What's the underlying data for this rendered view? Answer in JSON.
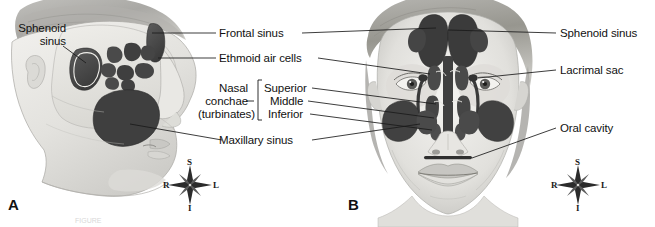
{
  "figure": {
    "caption_partial": "FIGURE",
    "panels": [
      {
        "id": "A",
        "letter": "A",
        "view": "lateral-sagittal-view"
      },
      {
        "id": "B",
        "letter": "B",
        "view": "anterior-frontal-view"
      }
    ]
  },
  "labels": {
    "left": [
      {
        "name": "sphenoid-sinus",
        "line1": "Sphenoid",
        "line2": "sinus"
      }
    ],
    "center": [
      {
        "name": "frontal-sinus",
        "text": "Frontal sinus"
      },
      {
        "name": "ethmoid-air-cells",
        "text": "Ethmoid air cells"
      },
      {
        "name": "maxillary-sinus",
        "text": "Maxillary sinus"
      }
    ],
    "group": {
      "name": "nasal-conchae",
      "line1": "Nasal",
      "line2": "conchae",
      "line3": "(turbinates)",
      "items": [
        {
          "name": "superior-concha",
          "text": "Superior"
        },
        {
          "name": "middle-concha",
          "text": "Middle"
        },
        {
          "name": "inferior-concha",
          "text": "Inferior"
        }
      ]
    },
    "right": [
      {
        "name": "sphenoid-sinus",
        "text": "Sphenoid sinus"
      },
      {
        "name": "lacrimal-sac",
        "text": "Lacrimal sac"
      },
      {
        "name": "oral-cavity",
        "text": "Oral cavity"
      }
    ]
  },
  "compass": {
    "superior": "S",
    "inferior": "I",
    "right": "R",
    "left": "L"
  },
  "colors": {
    "background": "#ffffff",
    "ink": "#111111",
    "leader_line": "#1a1a1a",
    "sinus_dark": "#4a4a4a",
    "sinus_darker": "#3a3a3a",
    "skin_light": "#ededea",
    "skin_mid": "#d5d4d0",
    "skin_shadow": "#b3b2ae",
    "hair": "#9a9995",
    "bone_light": "#e6e5e1"
  }
}
